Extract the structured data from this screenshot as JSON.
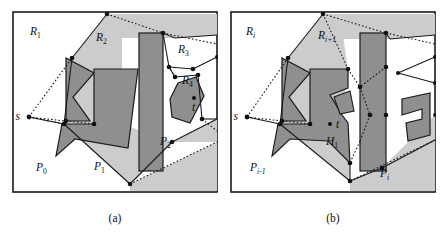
{
  "figure": {
    "type": "geometry-diagram",
    "captions": [
      {
        "id": "caption-a",
        "text": "(a)"
      },
      {
        "id": "caption-b",
        "text": "(b)"
      }
    ]
  },
  "panel_a": {
    "name": "panel-a",
    "region_labels": [
      {
        "key": "R1",
        "base": "R",
        "sub": "1",
        "x": 18,
        "y": 24
      },
      {
        "key": "R2",
        "base": "R",
        "sub": "2",
        "x": 84,
        "y": 30
      },
      {
        "key": "R3",
        "base": "R",
        "sub": "3",
        "x": 166,
        "y": 42
      },
      {
        "key": "R4",
        "base": "R",
        "sub": "4",
        "x": 172,
        "y": 72
      },
      {
        "key": "P0",
        "base": "P",
        "sub": "0",
        "x": 24,
        "y": 160
      },
      {
        "key": "P1",
        "base": "P",
        "sub": "1",
        "x": 82,
        "y": 159
      },
      {
        "key": "P2",
        "base": "P",
        "sub": "2",
        "x": 148,
        "y": 134
      }
    ],
    "points": [
      {
        "key": "s",
        "label": "s",
        "x": 17,
        "y": 106,
        "label_dx": -9,
        "label_dy": 3
      },
      {
        "key": "t",
        "label": "t",
        "x": 182,
        "y": 87,
        "label_dx": -2,
        "label_dy": 11
      }
    ]
  },
  "panel_b": {
    "name": "panel-b",
    "region_labels": [
      {
        "key": "Ri",
        "base": "R",
        "sub": "i",
        "x": 16,
        "y": 24
      },
      {
        "key": "Ri1",
        "base": "R",
        "sub": "i+1",
        "x": 90,
        "y": 28
      },
      {
        "key": "Pi-1",
        "base": "P",
        "sub": "i-1",
        "x": 22,
        "y": 160
      },
      {
        "key": "Pi",
        "base": "P",
        "sub": "i",
        "x": 148,
        "y": 165
      }
    ],
    "points": [
      {
        "key": "s",
        "label": "s",
        "x": 17,
        "y": 106,
        "label_dx": -9,
        "label_dy": 3
      },
      {
        "key": "t",
        "label": "t",
        "x": 100,
        "y": 113,
        "label_dx": 5,
        "label_dy": 3
      }
    ],
    "hole_labels": [
      {
        "key": "H1",
        "base": "H",
        "sub": "1",
        "x": 96,
        "y": 132
      }
    ]
  },
  "colors": {
    "page_background": "#ffffff",
    "panel_background": "#ffffff",
    "light_shade": "#cccccc",
    "mid_shade": "#bcbcbc",
    "obstacle_dark": "#8f8f8f",
    "obstacle_dark2": "#9a9a9a",
    "stroke": "#1a1a1a",
    "text": "#101010"
  }
}
